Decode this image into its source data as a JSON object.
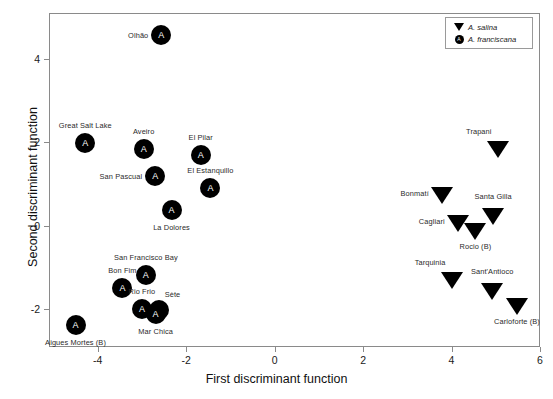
{
  "chart_data": {
    "type": "scatter",
    "title": "",
    "xlabel": "First discriminant function",
    "ylabel": "Second discriminant function",
    "xlim": [
      -5.1,
      6.0
    ],
    "ylim": [
      -2.9,
      5.1
    ],
    "xticks": [
      -4,
      -2,
      0,
      2,
      4,
      6
    ],
    "yticks": [
      -2,
      0,
      2,
      4
    ],
    "grid": false,
    "legend_position": "top-right",
    "legend": [
      {
        "label": "A. salina",
        "marker": "triangle-down",
        "color": "#000000"
      },
      {
        "label": "A. franciscana",
        "marker": "circle-A",
        "color": "#000000"
      }
    ],
    "series": [
      {
        "name": "A. franciscana",
        "marker": "circle-A",
        "points": [
          {
            "label": "Olhão",
            "x": -2.56,
            "y": 4.58,
            "label_pos": "left"
          },
          {
            "label": "Great Salt Lake",
            "x": -4.28,
            "y": 1.99,
            "label_pos": "above"
          },
          {
            "label": "Aveiro",
            "x": -2.96,
            "y": 1.84,
            "label_pos": "above"
          },
          {
            "label": "El Pilar",
            "x": -1.67,
            "y": 1.69,
            "label_pos": "above"
          },
          {
            "label": "San Pascual",
            "x": -2.7,
            "y": 1.19,
            "label_pos": "left"
          },
          {
            "label": "El Estanquillo",
            "x": -1.45,
            "y": 0.91,
            "label_pos": "above"
          },
          {
            "label": "La Dolores",
            "x": -2.33,
            "y": 0.37,
            "label_pos": "below"
          },
          {
            "label": "San Francisco Bay",
            "x": -2.91,
            "y": -1.17,
            "label_pos": "above"
          },
          {
            "label": "Bon Fim",
            "x": -3.44,
            "y": -1.48,
            "label_pos": "above"
          },
          {
            "label": "Rio Frio",
            "x": -3.0,
            "y": -2.0,
            "label_pos": "above"
          },
          {
            "label": "Sète",
            "x": -2.62,
            "y": -2.02,
            "label_pos": "above-right"
          },
          {
            "label": "Mar Chica",
            "x": -2.69,
            "y": -2.1,
            "label_pos": "below"
          },
          {
            "label": "Aigues Mortes (B)",
            "x": -4.5,
            "y": -2.38,
            "label_pos": "below"
          }
        ]
      },
      {
        "name": "A. salina",
        "marker": "triangle-down",
        "points": [
          {
            "label": "Trapani",
            "x": 5.04,
            "y": 1.9,
            "label_pos": "above-left"
          },
          {
            "label": "Bonmatí",
            "x": 3.78,
            "y": 0.79,
            "label_pos": "left"
          },
          {
            "label": "Santa Gilla",
            "x": 4.94,
            "y": 0.28,
            "label_pos": "above"
          },
          {
            "label": "Cagliari",
            "x": 4.14,
            "y": 0.11,
            "label_pos": "left"
          },
          {
            "label": "Rocio (B)",
            "x": 4.54,
            "y": -0.08,
            "label_pos": "below"
          },
          {
            "label": "Tarquinia",
            "x": 4.0,
            "y": -1.25,
            "label_pos": "above-left"
          },
          {
            "label": "Sant'Antioco",
            "x": 4.92,
            "y": -1.52,
            "label_pos": "above"
          },
          {
            "label": "Carloforte (B)",
            "x": 5.48,
            "y": -1.86,
            "label_pos": "below"
          }
        ]
      }
    ]
  }
}
